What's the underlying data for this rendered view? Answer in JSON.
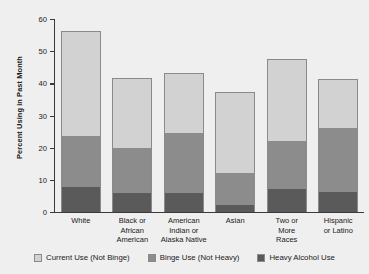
{
  "chart_data": {
    "type": "bar",
    "subtype": "stacked-bar",
    "title": "",
    "xlabel": "",
    "ylabel": "Percent Using in Past Month",
    "ylim": [
      0,
      60
    ],
    "yticks": [
      0,
      10,
      20,
      30,
      40,
      50,
      60
    ],
    "grid": false,
    "legend_position": "bottom",
    "categories": [
      "White",
      "Black or African American",
      "American Indian or Alaska Native",
      "Asian",
      "Two or More Races",
      "Hispanic or Latino"
    ],
    "category_lines": [
      [
        "White"
      ],
      [
        "Black or",
        "African",
        "American"
      ],
      [
        "American",
        "Indian or",
        "Alaska Native"
      ],
      [
        "Asian"
      ],
      [
        "Two or",
        "More",
        "Races"
      ],
      [
        "Hispanic",
        "or Latino"
      ]
    ],
    "series": [
      {
        "name": "Heavy Alcohol Use",
        "color": "#5a5a5a",
        "values": [
          7.8,
          5.8,
          5.9,
          2.2,
          7.2,
          6.3
        ]
      },
      {
        "name": "Binge Use (Not Heavy)",
        "color": "#8c8c8c",
        "values": [
          16.1,
          14.4,
          18.9,
          9.9,
          15.0,
          19.9
        ]
      },
      {
        "name": "Current Use (Not Binge)",
        "color": "#d2d2d2",
        "values": [
          32.4,
          21.6,
          18.4,
          25.2,
          25.3,
          15.1
        ]
      }
    ],
    "totals": [
      56.3,
      41.8,
      43.2,
      37.3,
      47.5,
      41.3
    ],
    "segment_tops": {
      "heavy": [
        7.8,
        5.8,
        5.9,
        2.2,
        7.2,
        6.3
      ],
      "binge": [
        23.9,
        20.2,
        24.8,
        12.1,
        22.2,
        26.2
      ],
      "current": [
        56.3,
        41.8,
        43.2,
        37.3,
        47.5,
        41.3
      ]
    },
    "legend": [
      {
        "label": "Current Use (Not Binge)",
        "key": "current",
        "color": "#d2d2d2"
      },
      {
        "label": "Binge Use (Not Heavy)",
        "key": "binge",
        "color": "#8c8c8c"
      },
      {
        "label": "Heavy Alcohol Use",
        "key": "heavy",
        "color": "#5a5a5a"
      }
    ]
  },
  "colors": {
    "background": "#efefef",
    "axis": "#3a3a3a",
    "text": "#1a1a1a",
    "current": "#d2d2d2",
    "binge": "#8c8c8c",
    "heavy": "#5a5a5a"
  }
}
